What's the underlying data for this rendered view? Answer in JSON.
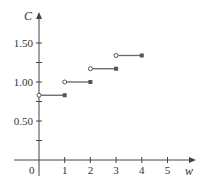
{
  "chart_data": {
    "type": "line",
    "subtype": "step-function",
    "title": "",
    "xlabel": "w",
    "ylabel": "C",
    "xlim": [
      0,
      5.3
    ],
    "ylim": [
      0,
      1.75
    ],
    "x_ticks": [
      1,
      2,
      3,
      4,
      5
    ],
    "x_tick_labels": [
      "1",
      "2",
      "3",
      "4",
      "5"
    ],
    "y_ticks": [
      0.25,
      0.5,
      0.75,
      1.0,
      1.25,
      1.5
    ],
    "y_tick_labels": [
      "",
      "0.50",
      "",
      "1.00",
      "",
      "1.50"
    ],
    "origin_label": "0",
    "grid": false,
    "legend": null,
    "segments": [
      {
        "x_start": 0,
        "x_end": 1,
        "y": 0.83,
        "start_open": true,
        "end_closed": true
      },
      {
        "x_start": 1,
        "x_end": 2,
        "y": 1.0,
        "start_open": true,
        "end_closed": true
      },
      {
        "x_start": 2,
        "x_end": 3,
        "y": 1.17,
        "start_open": true,
        "end_closed": true
      },
      {
        "x_start": 3,
        "x_end": 4,
        "y": 1.34,
        "start_open": true,
        "end_closed": true
      }
    ],
    "colors": {
      "axis": "#444444",
      "segment": "#666666",
      "point": "#555555"
    }
  }
}
